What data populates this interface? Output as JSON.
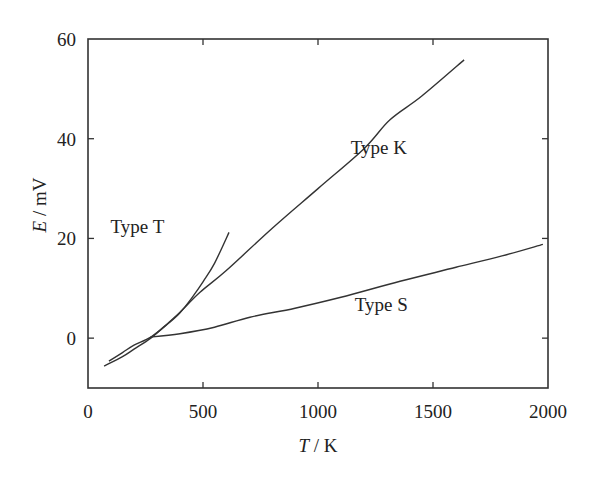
{
  "chart_data": {
    "type": "line",
    "title": "",
    "xlabel": "T / K",
    "xlabel_var": "T",
    "xlabel_unit": " / K",
    "ylabel": "E / mV",
    "ylabel_var": "E",
    "ylabel_unit": " / mV",
    "xlim": [
      0,
      2000
    ],
    "ylim": [
      -10,
      60
    ],
    "xticks": [
      0,
      500,
      1000,
      1500,
      2000
    ],
    "yticks": [
      0,
      20,
      40,
      60
    ],
    "xtick_labels": [
      "0",
      "500",
      "1000",
      "1500",
      "2000"
    ],
    "ytick_labels": [
      "0",
      "20",
      "40",
      "60"
    ],
    "grid": false,
    "legend": "none (inline curve labels)",
    "series": [
      {
        "name": "Type T",
        "label": "Type T",
        "label_pos": [
          215,
          21
        ],
        "x": [
          91,
          150,
          200,
          273,
          350,
          400,
          450,
          500,
          550,
          613
        ],
        "y": [
          -4.6,
          -2.9,
          -1.4,
          0.2,
          3.0,
          5.1,
          8.0,
          11.3,
          15.0,
          21.2
        ]
      },
      {
        "name": "Type K",
        "label": "Type K",
        "label_pos": [
          1265,
          37
        ],
        "x": [
          70,
          150,
          200,
          273,
          350,
          400,
          487,
          600,
          800,
          1000,
          1200,
          1313,
          1450,
          1635
        ],
        "y": [
          -5.6,
          -3.7,
          -2.2,
          0.0,
          3.1,
          5.2,
          9.2,
          13.5,
          22.0,
          30.0,
          38.0,
          43.8,
          48.5,
          55.8
        ]
      },
      {
        "name": "Type S",
        "label": "Type S",
        "label_pos": [
          1275,
          5.5
        ],
        "x": [
          270,
          400,
          550,
          704,
          900,
          1100,
          1357,
          1600,
          1800,
          1978
        ],
        "y": [
          0.2,
          0.9,
          2.2,
          4.2,
          6.0,
          8.2,
          11.4,
          14.2,
          16.5,
          18.8
        ]
      }
    ]
  },
  "plot_area": {
    "left": 88,
    "top": 39,
    "right": 548,
    "bottom": 388
  },
  "colors": {
    "axis": "#333333",
    "line": "#333333",
    "background": "#ffffff"
  }
}
